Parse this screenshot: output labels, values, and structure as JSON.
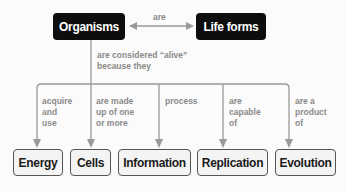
{
  "top_nodes": {
    "organisms": "Organisms",
    "life_forms": "Life forms"
  },
  "top_link_label": "are",
  "central_link_label": "are considered “alive”\nbecause they",
  "branches": [
    {
      "label": "acquire\nand\nuse",
      "target": "Energy"
    },
    {
      "label": "are made\nup of one\nor more",
      "target": "Cells"
    },
    {
      "label": "process",
      "target": "Information"
    },
    {
      "label": "are\ncapable\nof",
      "target": "Replication"
    },
    {
      "label": "are a\nproduct\nof",
      "target": "Evolution"
    }
  ],
  "colors": {
    "dark_node": "#0d0d0d",
    "light_node": "#f4f4f4",
    "connector": "#9a9a9a",
    "label_text": "#8a8a8a"
  }
}
